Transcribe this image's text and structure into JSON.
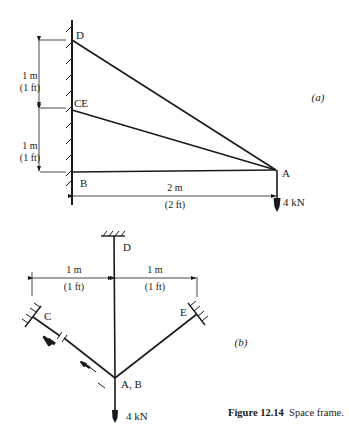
{
  "figure": {
    "number": "Figure 12.14",
    "title": "Space frame."
  },
  "panel_a": {
    "label": "(a)",
    "nodes": {
      "D": "D",
      "CE": "CE",
      "B": "B",
      "A": "A"
    },
    "dimensions": {
      "upper_vertical": {
        "si": "1 m",
        "imperial": "(1 ft)"
      },
      "lower_vertical": {
        "si": "1 m",
        "imperial": "(1 ft)"
      },
      "horizontal": {
        "si": "2 m",
        "imperial": "(2 ft)"
      }
    },
    "load": "4 kN"
  },
  "panel_b": {
    "label": "(b)",
    "nodes": {
      "D": "D",
      "C": "C",
      "E": "E",
      "AB": "A, B"
    },
    "dimensions": {
      "left": {
        "si": "1 m",
        "imperial": "(1 ft)"
      },
      "right": {
        "si": "1 m",
        "imperial": "(1 ft)"
      }
    },
    "load": "4 kN"
  }
}
